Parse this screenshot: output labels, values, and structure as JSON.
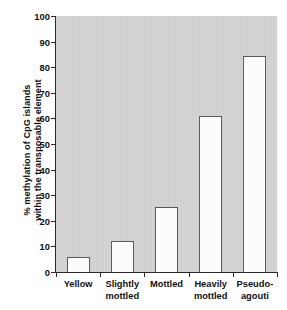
{
  "chart_data": {
    "type": "bar",
    "title": "",
    "subtitle": "",
    "xlabel": "",
    "ylabel": "% methylation of CpG islands within the transposable element",
    "ylabel_lines": [
      "% methylation of CpG islands",
      "within the transposable element"
    ],
    "categories": [
      "Yellow",
      "Slightly mottled",
      "Mottled",
      "Heavily mottled",
      "Pseudo-agouti"
    ],
    "category_lines": [
      [
        "Yellow"
      ],
      [
        "Slightly",
        "mottled"
      ],
      [
        "Mottled"
      ],
      [
        "Heavily",
        "mottled"
      ],
      [
        "Pseudo-",
        "agouti"
      ]
    ],
    "values": [
      6,
      12,
      25.5,
      61,
      84.5
    ],
    "ylim": [
      0,
      100
    ],
    "ytick_values": [
      0,
      10,
      20,
      30,
      40,
      50,
      60,
      70,
      80,
      90,
      100
    ],
    "ytick_labels": [
      "0",
      "10",
      "20",
      "30",
      "40",
      "50",
      "60",
      "70",
      "80",
      "90",
      "100"
    ],
    "grid": false,
    "legend": false,
    "legend_position": "none",
    "colors": {
      "plot_background": "#d3d3d3",
      "figure_background": "#ffffff",
      "bar_fill": "#fcfcfc",
      "bar_edge": "#5a5a5a",
      "axis": "#2a2a2a",
      "text": "#111111"
    }
  }
}
